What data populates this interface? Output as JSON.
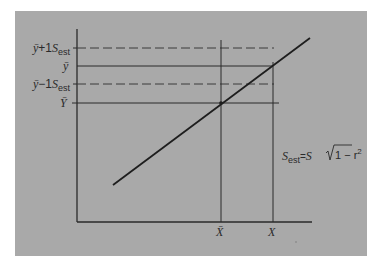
{
  "diagram": {
    "title": "",
    "background_color": "#a9a9a9",
    "line_color": "#2a2a2a",
    "y_axis_labels": [
      {
        "id": "y_hat_plus",
        "base": "ȳ",
        "operator": "+1",
        "s": "S",
        "sub": "est",
        "y": 48,
        "style": "dashed"
      },
      {
        "id": "y_hat",
        "base": "ȳ",
        "y": 66,
        "style": "solid"
      },
      {
        "id": "y_hat_minus",
        "base": "ȳ",
        "operator": "−1",
        "s": "S",
        "sub": "est",
        "y": 84,
        "style": "dashed"
      },
      {
        "id": "y_bar",
        "base": "Ȳ",
        "y": 103,
        "style": "solid"
      }
    ],
    "x_axis_labels": [
      {
        "id": "x_bar",
        "text": "X̄",
        "x": 221
      },
      {
        "id": "x",
        "text": "X",
        "x": 273
      }
    ],
    "formula": {
      "lhs": "S",
      "lhs_sub": "est",
      "equals": "=",
      "rhs_s": "S",
      "radicand": "1 − r",
      "exponent": "2"
    },
    "regression_line": {
      "x1": 113,
      "y1": 185,
      "x2": 310,
      "y2": 38
    },
    "mean_point": {
      "x": 221,
      "y": 103
    }
  }
}
